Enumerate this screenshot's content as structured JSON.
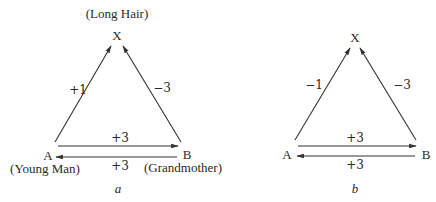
{
  "diagrams": [
    {
      "caption": "a",
      "nodes": {
        "X": {
          "letter": "X",
          "name": "(Long Hair)"
        },
        "A": {
          "letter": "A",
          "name": "(Young Man)"
        },
        "B": {
          "letter": "B",
          "name": "(Grandmother)"
        }
      },
      "edges": {
        "A_to_X": "+1",
        "B_to_X": "−3",
        "A_to_B": "+3",
        "B_to_A": "+3"
      }
    },
    {
      "caption": "b",
      "nodes": {
        "X": {
          "letter": "X"
        },
        "A": {
          "letter": "A"
        },
        "B": {
          "letter": "B"
        }
      },
      "edges": {
        "A_to_X": "−1",
        "B_to_X": "−3",
        "A_to_B": "+3",
        "B_to_A": "+3"
      }
    }
  ]
}
